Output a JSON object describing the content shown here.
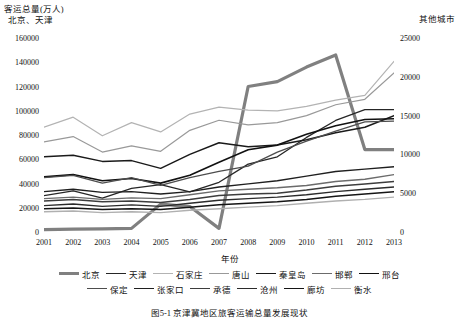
{
  "chart_data": {
    "type": "line",
    "title": "",
    "caption": "图5-1  京津冀地区旅客运输总量发展现状",
    "xlabel": "年份",
    "ylabel_left": "客运总量(万人)\n  北京、天津",
    "ylabel_right": "其他城市",
    "x": [
      2001,
      2002,
      2003,
      2004,
      2005,
      2006,
      2007,
      2008,
      2009,
      2010,
      2011,
      2012,
      2013
    ],
    "xtick_labels": [
      "2001",
      "2002",
      "2003",
      "2004",
      "2005",
      "2006",
      "2007",
      "2008",
      "2009",
      "2010",
      "2011",
      "2012",
      "2013"
    ],
    "ylim_left": [
      0,
      160000
    ],
    "ytick_labels_left": [
      "0",
      "20000",
      "40000",
      "60000",
      "80000",
      "100000",
      "120000",
      "140000",
      "160000"
    ],
    "ytick_values_left": [
      0,
      20000,
      40000,
      60000,
      80000,
      100000,
      120000,
      140000,
      160000
    ],
    "ylim_right": [
      0,
      25000
    ],
    "ytick_labels_right": [
      "0",
      "5000",
      "10000",
      "15000",
      "20000",
      "25000"
    ],
    "ytick_values_right": [
      0,
      5000,
      10000,
      15000,
      20000,
      25000
    ],
    "grid": false,
    "legend_position": "bottom",
    "legend_rows": [
      [
        "北京",
        "天津",
        "石家庄",
        "唐山",
        "秦皇岛",
        "邯郸",
        "邢台"
      ],
      [
        "保定",
        "张家口",
        "承德",
        "沧州",
        "廊坊",
        "衡水"
      ]
    ],
    "series": [
      {
        "name": "北京",
        "axis": "left",
        "color": "#808080",
        "width": 3.2,
        "values": [
          2000,
          2400,
          2600,
          3000,
          23000,
          21000,
          3000,
          120000,
          124000,
          136000,
          146000,
          68000,
          68000
        ]
      },
      {
        "name": "天津",
        "axis": "left",
        "color": "#262626",
        "width": 1.3,
        "values": [
          30000,
          34000,
          28000,
          36000,
          39000,
          33000,
          41000,
          56000,
          62000,
          78000,
          92000,
          101000,
          101000
        ]
      },
      {
        "name": "石家庄",
        "axis": "right",
        "color": "#b3b3b3",
        "width": 1.2,
        "values": [
          13500,
          14800,
          12400,
          14100,
          12900,
          15200,
          16100,
          15700,
          15600,
          16200,
          17000,
          17600,
          22000
        ]
      },
      {
        "name": "唐山",
        "axis": "right",
        "color": "#999999",
        "width": 1.2,
        "values": [
          11600,
          12300,
          10300,
          11100,
          10400,
          13100,
          14400,
          13800,
          14100,
          15000,
          16400,
          17100,
          20500
        ]
      },
      {
        "name": "秦皇岛",
        "axis": "right",
        "color": "#1a1a1a",
        "width": 1.5,
        "values": [
          9700,
          9900,
          9100,
          9200,
          8200,
          10000,
          11500,
          11000,
          11200,
          11900,
          12800,
          13500,
          15000
        ]
      },
      {
        "name": "邯郸",
        "axis": "right",
        "color": "#6b6b6b",
        "width": 1.4,
        "values": [
          4300,
          4500,
          4200,
          4400,
          4300,
          4800,
          5300,
          5500,
          5700,
          6000,
          6500,
          6800,
          7400
        ]
      },
      {
        "name": "邢台",
        "axis": "right",
        "color": "#111111",
        "width": 1.6,
        "values": [
          7100,
          7400,
          6600,
          6900,
          6300,
          7300,
          9000,
          10600,
          11200,
          12600,
          13700,
          14500,
          14600
        ]
      },
      {
        "name": "保定",
        "axis": "right",
        "color": "#4d4d4d",
        "width": 1.3,
        "values": [
          7000,
          7300,
          6300,
          7000,
          6000,
          7000,
          7800,
          8500,
          10300,
          11700,
          13000,
          14200,
          14300
        ]
      },
      {
        "name": "张家口",
        "axis": "right",
        "color": "#1f1f1f",
        "width": 1.4,
        "values": [
          5200,
          5500,
          5100,
          5200,
          4900,
          5200,
          5800,
          6200,
          6600,
          7200,
          7800,
          8100,
          8400
        ]
      },
      {
        "name": "承德",
        "axis": "right",
        "color": "#3d3d3d",
        "width": 1.5,
        "values": [
          4000,
          4200,
          3900,
          4000,
          3800,
          4200,
          4700,
          4900,
          5000,
          5400,
          5900,
          6200,
          6500
        ]
      },
      {
        "name": "沧州",
        "axis": "right",
        "color": "#2b2b2b",
        "width": 1.4,
        "values": [
          3400,
          3600,
          3300,
          3500,
          3300,
          3700,
          4100,
          4300,
          4500,
          4800,
          5200,
          5500,
          5800
        ]
      },
      {
        "name": "廊坊",
        "axis": "right",
        "color": "#151515",
        "width": 1.5,
        "values": [
          3000,
          3100,
          2900,
          3000,
          2900,
          3200,
          3500,
          3700,
          3900,
          4200,
          4600,
          4900,
          5200
        ]
      },
      {
        "name": "衡水",
        "axis": "right",
        "color": "#b0b0b0",
        "width": 1.4,
        "values": [
          2600,
          2700,
          2500,
          2600,
          2500,
          2800,
          3000,
          3200,
          3400,
          3700,
          4000,
          4200,
          4500
        ]
      }
    ]
  }
}
